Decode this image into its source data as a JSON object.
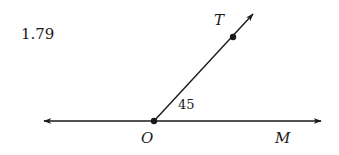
{
  "problem": {
    "number": "1.79"
  },
  "diagram": {
    "points": {
      "O": {
        "label": "O",
        "x": 154,
        "y": 121
      },
      "T": {
        "label": "T",
        "x": 233,
        "y": 37
      },
      "M": {
        "label": "M"
      }
    },
    "line": {
      "x1": 44,
      "y1": 121,
      "x2": 321,
      "y2": 121,
      "arrows": "both"
    },
    "ray": {
      "x1": 154,
      "y1": 121,
      "x2": 253,
      "y2": 14,
      "arrows": "end"
    },
    "angle": {
      "label": "45",
      "between": [
        "OT",
        "OM"
      ]
    },
    "stroke_color": "#1a1a1a"
  }
}
